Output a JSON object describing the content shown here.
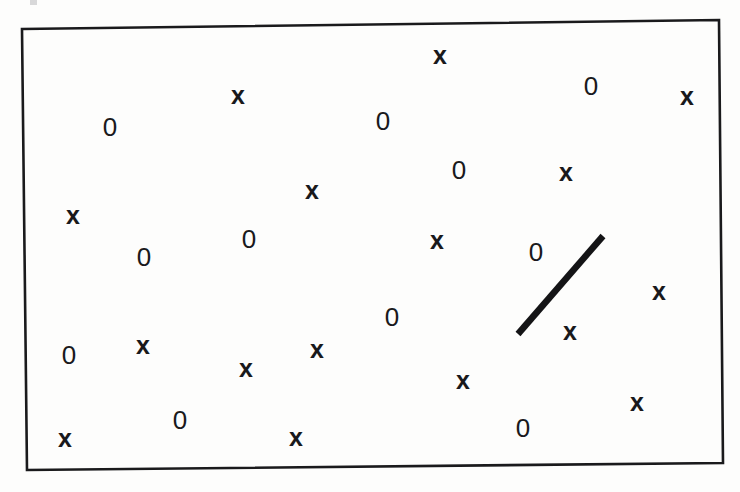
{
  "figure": {
    "caption": "",
    "background_color": "#fdfdfc",
    "ink_color": "#19191b",
    "width": 740,
    "height": 492
  },
  "boundary_box": {
    "name": "hand-drawn rectangle border",
    "stroke_color": "#1a1a1c",
    "stroke_width": 2.6,
    "corners": [
      {
        "label": "top-left",
        "x": 22,
        "y": 29
      },
      {
        "label": "top-right",
        "x": 719,
        "y": 20
      },
      {
        "label": "bottom-right",
        "x": 723,
        "y": 463
      },
      {
        "label": "bottom-left",
        "x": 27,
        "y": 470
      }
    ]
  },
  "line_segment": {
    "name": "thick diagonal line segment",
    "stroke_color": "#141416",
    "stroke_width": 6.5,
    "x1": 518,
    "y1": 334,
    "x2": 603,
    "y2": 236,
    "orientation": "bottom-left to top-right"
  },
  "chart_data": {
    "type": "scatter",
    "title": "",
    "xlabel": "",
    "ylabel": "",
    "xlim": [
      22,
      723
    ],
    "ylim": [
      20,
      470
    ],
    "grid": false,
    "legend": "none",
    "marker_labels": [
      "0",
      "x"
    ],
    "counts": {
      "0": 12,
      "x": 19,
      "total": 31
    },
    "series": [
      {
        "name": "0",
        "marker": "0",
        "count": 12,
        "points": [
          {
            "x": 110,
            "y": 127,
            "size": 25
          },
          {
            "x": 383,
            "y": 121,
            "size": 25
          },
          {
            "x": 591,
            "y": 86,
            "size": 25
          },
          {
            "x": 459,
            "y": 170,
            "size": 25
          },
          {
            "x": 249,
            "y": 239,
            "size": 25
          },
          {
            "x": 144,
            "y": 257,
            "size": 25
          },
          {
            "x": 536,
            "y": 252,
            "size": 25
          },
          {
            "x": 392,
            "y": 317,
            "size": 25
          },
          {
            "x": 69,
            "y": 355,
            "size": 25
          },
          {
            "x": 180,
            "y": 420,
            "size": 25
          },
          {
            "x": 523,
            "y": 428,
            "size": 25
          },
          {
            "x": 0,
            "y": 0,
            "size": 0
          }
        ]
      },
      {
        "name": "x",
        "marker": "x",
        "count": 19,
        "points": [
          {
            "x": 440,
            "y": 55,
            "size": 24
          },
          {
            "x": 238,
            "y": 95,
            "size": 24
          },
          {
            "x": 687,
            "y": 96,
            "size": 24
          },
          {
            "x": 566,
            "y": 172,
            "size": 24
          },
          {
            "x": 312,
            "y": 190,
            "size": 24
          },
          {
            "x": 73,
            "y": 215,
            "size": 24
          },
          {
            "x": 437,
            "y": 240,
            "size": 24
          },
          {
            "x": 659,
            "y": 291,
            "size": 24
          },
          {
            "x": 570,
            "y": 331,
            "size": 24
          },
          {
            "x": 143,
            "y": 345,
            "size": 24
          },
          {
            "x": 317,
            "y": 349,
            "size": 24
          },
          {
            "x": 246,
            "y": 368,
            "size": 24
          },
          {
            "x": 463,
            "y": 380,
            "size": 24
          },
          {
            "x": 637,
            "y": 402,
            "size": 24
          },
          {
            "x": 296,
            "y": 437,
            "size": 24
          },
          {
            "x": 65,
            "y": 438,
            "size": 24
          }
        ]
      }
    ]
  },
  "symbols": [
    {
      "glyph": "x",
      "x": 440,
      "y": 55,
      "size": 25,
      "kind": "ex"
    },
    {
      "glyph": "0",
      "x": 591,
      "y": 86,
      "size": 26,
      "kind": "zero"
    },
    {
      "glyph": "x",
      "x": 238,
      "y": 95,
      "size": 25,
      "kind": "ex"
    },
    {
      "glyph": "x",
      "x": 687,
      "y": 96,
      "size": 25,
      "kind": "ex"
    },
    {
      "glyph": "0",
      "x": 383,
      "y": 121,
      "size": 26,
      "kind": "zero"
    },
    {
      "glyph": "0",
      "x": 110,
      "y": 127,
      "size": 26,
      "kind": "zero"
    },
    {
      "glyph": "0",
      "x": 459,
      "y": 170,
      "size": 26,
      "kind": "zero"
    },
    {
      "glyph": "x",
      "x": 566,
      "y": 172,
      "size": 25,
      "kind": "ex"
    },
    {
      "glyph": "x",
      "x": 312,
      "y": 190,
      "size": 25,
      "kind": "ex"
    },
    {
      "glyph": "x",
      "x": 73,
      "y": 215,
      "size": 25,
      "kind": "ex"
    },
    {
      "glyph": "0",
      "x": 249,
      "y": 239,
      "size": 26,
      "kind": "zero"
    },
    {
      "glyph": "x",
      "x": 437,
      "y": 240,
      "size": 25,
      "kind": "ex"
    },
    {
      "glyph": "0",
      "x": 536,
      "y": 252,
      "size": 26,
      "kind": "zero"
    },
    {
      "glyph": "0",
      "x": 144,
      "y": 257,
      "size": 26,
      "kind": "zero"
    },
    {
      "glyph": "x",
      "x": 659,
      "y": 291,
      "size": 25,
      "kind": "ex"
    },
    {
      "glyph": "0",
      "x": 392,
      "y": 317,
      "size": 26,
      "kind": "zero"
    },
    {
      "glyph": "x",
      "x": 570,
      "y": 331,
      "size": 25,
      "kind": "ex"
    },
    {
      "glyph": "x",
      "x": 143,
      "y": 345,
      "size": 25,
      "kind": "ex"
    },
    {
      "glyph": "x",
      "x": 317,
      "y": 349,
      "size": 25,
      "kind": "ex"
    },
    {
      "glyph": "0",
      "x": 69,
      "y": 355,
      "size": 26,
      "kind": "zero"
    },
    {
      "glyph": "x",
      "x": 246,
      "y": 368,
      "size": 25,
      "kind": "ex"
    },
    {
      "glyph": "x",
      "x": 463,
      "y": 380,
      "size": 25,
      "kind": "ex"
    },
    {
      "glyph": "x",
      "x": 637,
      "y": 402,
      "size": 25,
      "kind": "ex"
    },
    {
      "glyph": "0",
      "x": 180,
      "y": 420,
      "size": 26,
      "kind": "zero"
    },
    {
      "glyph": "0",
      "x": 523,
      "y": 428,
      "size": 26,
      "kind": "zero"
    },
    {
      "glyph": "x",
      "x": 296,
      "y": 437,
      "size": 25,
      "kind": "ex"
    },
    {
      "glyph": "x",
      "x": 65,
      "y": 438,
      "size": 25,
      "kind": "ex"
    }
  ],
  "scan_artifacts": [
    {
      "x": 30,
      "y": 0,
      "w": 7,
      "h": 5
    }
  ]
}
